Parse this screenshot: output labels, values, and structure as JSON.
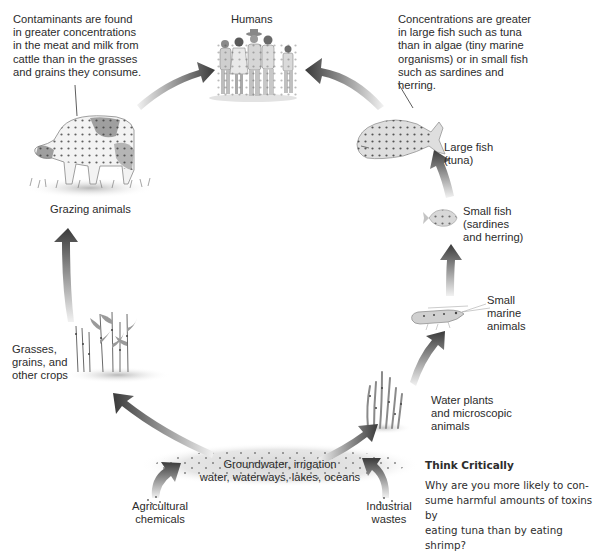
{
  "diagram": {
    "nodes": [
      {
        "id": "humans",
        "label": "Humans"
      },
      {
        "id": "grazing",
        "label": "Grazing animals"
      },
      {
        "id": "crops",
        "label": "Grasses,\ngrains, and\nother crops"
      },
      {
        "id": "water",
        "label": "Groundwater, irrigation\nwater, waterways, lakes, oceans"
      },
      {
        "id": "agri",
        "label": "Agricultural\nchemicals"
      },
      {
        "id": "industrial",
        "label": "Industrial\nwastes"
      },
      {
        "id": "waterplants",
        "label": "Water plants\nand microscopic\nanimals"
      },
      {
        "id": "smallmarine",
        "label": "Small\nmarine\nanimals"
      },
      {
        "id": "smallfish",
        "label": "Small fish\n(sardines\nand herring)"
      },
      {
        "id": "largefish",
        "label": "Large fish\n(tuna)"
      }
    ],
    "edges": [
      {
        "from": "agri",
        "to": "water"
      },
      {
        "from": "industrial",
        "to": "water"
      },
      {
        "from": "water",
        "to": "crops"
      },
      {
        "from": "water",
        "to": "waterplants"
      },
      {
        "from": "crops",
        "to": "grazing"
      },
      {
        "from": "grazing",
        "to": "humans"
      },
      {
        "from": "waterplants",
        "to": "smallmarine"
      },
      {
        "from": "smallmarine",
        "to": "smallfish"
      },
      {
        "from": "smallfish",
        "to": "largefish"
      },
      {
        "from": "largefish",
        "to": "humans"
      }
    ],
    "callouts": {
      "cattle": "Contaminants are found\nin greater concentrations\nin the meat and milk from\ncattle than in the grasses\nand grains they consume.",
      "fish": "Concentrations are greater\nin large fish such as tuna\nthan in algae (tiny marine\norganisms) or in small fish\nsuch as sardines and\nherring."
    },
    "think_critically": {
      "title": "Think Critically",
      "body": "Why are you more likely to con-\nsume harmful amounts of toxins by\neating tuna than by eating shrimp?"
    }
  },
  "colors": {
    "arrow_dark": "#3a3a3a",
    "arrow_light": "#e8e8e8",
    "text": "#2b2b2b",
    "dot": "#3c3c3c",
    "water_haze": "#dcdcdc"
  }
}
